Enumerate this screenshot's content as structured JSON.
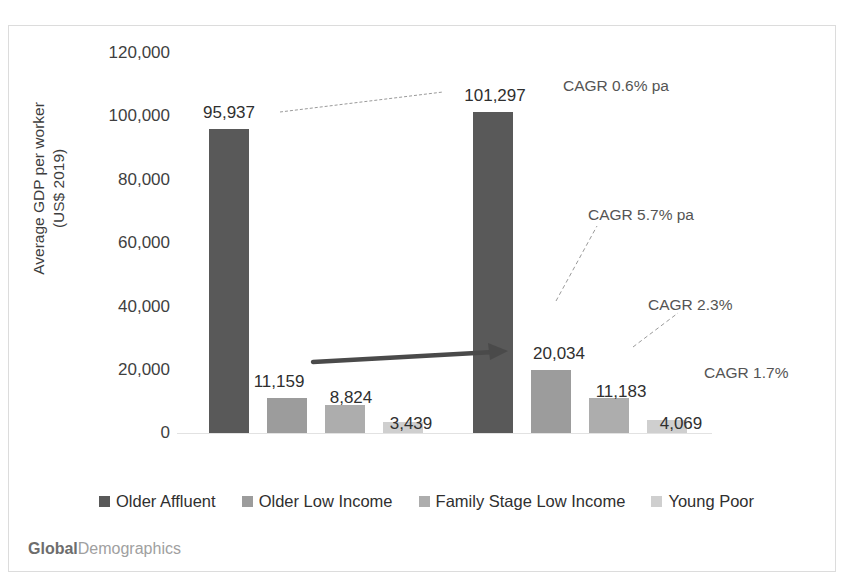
{
  "chart_data": {
    "type": "bar",
    "title": "",
    "xlabel": "",
    "ylabel": "Average GDP per worker\n(US$ 2019)",
    "ylim": [
      0,
      120000
    ],
    "ytick_labels": [
      "0",
      "20,000",
      "40,000",
      "60,000",
      "80,000",
      "100,000",
      "120,000"
    ],
    "ytick_values": [
      0,
      20000,
      40000,
      60000,
      80000,
      100000,
      120000
    ],
    "grid": false,
    "legend_position": "bottom",
    "categories": [
      "Group 1",
      "Group 2"
    ],
    "series": [
      {
        "name": "Older Affluent",
        "color": "#595959",
        "values": [
          95937,
          101297
        ],
        "labels": [
          "95,937",
          "101,297"
        ]
      },
      {
        "name": "Older Low Income",
        "color": "#9c9c9c",
        "values": [
          11159,
          20034
        ],
        "labels": [
          "11,159",
          "20,034"
        ]
      },
      {
        "name": "Family Stage Low Income",
        "color": "#adadad",
        "values": [
          8824,
          11183
        ],
        "labels": [
          "8,824",
          "11,183"
        ]
      },
      {
        "name": "Young Poor",
        "color": "#cfcfcf",
        "values": [
          3439,
          4069
        ],
        "labels": [
          "3,439",
          "4,069"
        ]
      }
    ],
    "annotations": [
      {
        "text": "CAGR 0.6% pa",
        "x": 563,
        "y": 77
      },
      {
        "text": "CAGR 5.7% pa",
        "x": 588,
        "y": 206
      },
      {
        "text": "CAGR 2.3%",
        "x": 648,
        "y": 296
      },
      {
        "text": "CAGR 1.7%",
        "x": 704,
        "y": 364
      }
    ]
  },
  "legend": {
    "items": [
      {
        "label": "Older Affluent",
        "color": "#595959"
      },
      {
        "label": "Older Low Income",
        "color": "#9c9c9c"
      },
      {
        "label": "Family Stage Low Income",
        "color": "#adadad"
      },
      {
        "label": "Young Poor",
        "color": "#cfcfcf"
      }
    ]
  },
  "brand": {
    "strong": "Global",
    "light": "Demographics"
  },
  "axis": {
    "y_title": "Average GDP per worker\n(US$ 2019)",
    "ticks": [
      "120,000",
      "100,000",
      "80,000",
      "60,000",
      "40,000",
      "20,000",
      "0"
    ]
  }
}
